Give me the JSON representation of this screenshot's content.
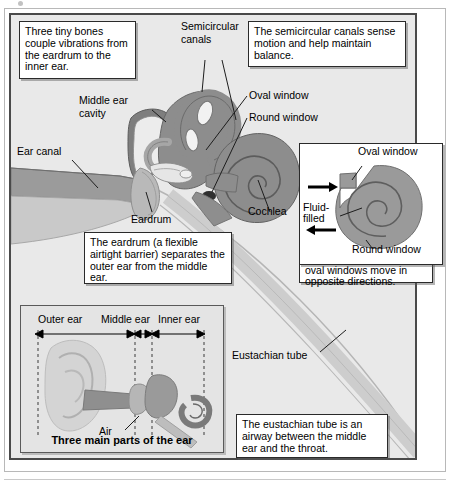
{
  "figure": {
    "background": "#e9e9e9",
    "colors": {
      "tissue_dark": "#8a8a8a",
      "tissue_mid": "#9e9e9e",
      "tissue_light": "#c4c4c4",
      "bone_light": "#dcdcdc",
      "outline": "#3a3a3a",
      "panel": "#e9e9e9",
      "box_fill": "#ffffff",
      "box_border": "#2a2a2a"
    }
  },
  "callouts": [
    {
      "id": "bones",
      "name": "callout-three-tiny-bones",
      "text": "Three tiny bones couple vibrations from the eardrum to the inner ear."
    },
    {
      "id": "canals",
      "name": "callout-semicircular-canals",
      "text": "The semicircular canals sense motion and help maintain balance."
    },
    {
      "id": "eardrum",
      "name": "callout-eardrum",
      "text": "The eardrum (a flexible airtight barrier) separates the outer ear from the middle ear."
    },
    {
      "id": "windows",
      "name": "callout-round-oval-windows",
      "text": "To couple sound to the cochlea, the round and oval windows move in opposite directions."
    },
    {
      "id": "eustachian",
      "name": "callout-eustachian-tube",
      "text": "The eustachian tube is an airway between the middle ear and the throat."
    }
  ],
  "labels": {
    "semicircular_canals": "Semicircular canals",
    "middle_ear_cavity": "Middle ear cavity",
    "ear_canal": "Ear canal",
    "eardrum": "Eardrum",
    "oval_window": "Oval window",
    "round_window": "Round window",
    "cochlea": "Cochlea",
    "eustachian_tube": "Eustachian tube"
  },
  "cochlea_inset": {
    "oval_window": "Oval window",
    "round_window": "Round window",
    "fluid_filled": "Fluid-\nfilled",
    "fluid_filled_line1": "Fluid-",
    "fluid_filled_line2": "filled",
    "arrow_in": "arrow pointing right into oval window",
    "arrow_out": "arrow pointing left out of round window"
  },
  "ear_inset": {
    "caption": "Three main parts of the ear",
    "regions": [
      "Outer ear",
      "Middle ear",
      "Inner ear"
    ],
    "air_label": "Air"
  }
}
